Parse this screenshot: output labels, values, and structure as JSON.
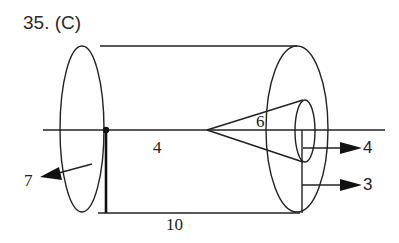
{
  "problem": {
    "title": "35. (C)"
  },
  "diagram": {
    "stroke_color": "#222222",
    "labels": {
      "cone_angle_label": "6",
      "axis_label": "4",
      "length_label": "10",
      "left_arrow_label": "7",
      "right_arrow_upper_label": "4",
      "right_arrow_lower_label": "3"
    }
  }
}
